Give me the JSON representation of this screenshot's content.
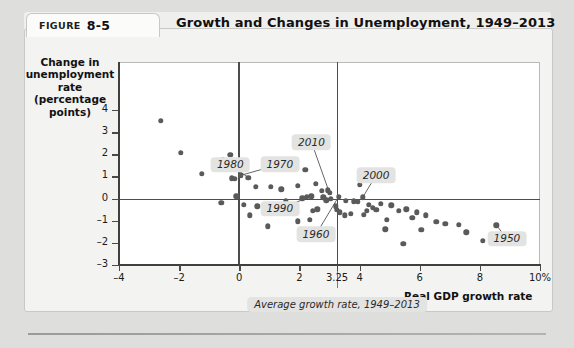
{
  "figure": {
    "label_word": "FIGURE",
    "number": "8-5",
    "title": "Growth and Changes in Unemployment, 1949–2013"
  },
  "chart_data": {
    "type": "scatter",
    "title": "Growth and Changes in Unemployment, 1949–2013",
    "xlabel": "Real GDP growth rate",
    "ylabel": "Change in unemployment rate (percentage points)",
    "xlim": [
      -4,
      10
    ],
    "ylim": [
      -3,
      4
    ],
    "grid": false,
    "legend": null,
    "xticks": [
      -4,
      -2,
      0,
      2,
      3.25,
      4,
      6,
      8,
      10
    ],
    "xticklabels": [
      "-4",
      "-2",
      "0",
      "2",
      "3.25",
      "4",
      "6",
      "8",
      "10%"
    ],
    "yticks": [
      -3,
      -2,
      -1,
      0,
      1,
      2,
      3,
      4
    ],
    "yticklabels": [
      "-3",
      "-2",
      "-1",
      "0",
      "1",
      "2",
      "3",
      "4"
    ],
    "reference_lines": [
      {
        "name": "zero-change-line",
        "axis": "horizontal",
        "value": 0
      },
      {
        "name": "zero-growth-line",
        "axis": "vertical",
        "value": 0
      },
      {
        "name": "average-growth-line",
        "axis": "vertical",
        "value": 3.25
      }
    ],
    "annotations": [
      {
        "label": "1980",
        "label_x": -0.3,
        "label_y": 1.52,
        "point_x": 0.3,
        "point_y": 0.95
      },
      {
        "label": "1970",
        "label_x": 1.35,
        "label_y": 1.55,
        "point_x": 0.05,
        "point_y": 1.05
      },
      {
        "label": "2010",
        "label_x": 2.4,
        "label_y": 2.55,
        "point_x": 3.0,
        "point_y": 0.25
      },
      {
        "label": "2000",
        "label_x": 4.55,
        "label_y": 1.05,
        "point_x": 4.1,
        "point_y": 0.05
      },
      {
        "label": "1990",
        "label_x": 1.35,
        "label_y": -0.45,
        "point_x": 2.4,
        "point_y": 0.1
      },
      {
        "label": "1960",
        "label_x": 2.55,
        "label_y": -1.62,
        "point_x": 3.3,
        "point_y": 0.08
      },
      {
        "label": "1950",
        "label_x": 8.9,
        "label_y": -1.82,
        "point_x": 8.55,
        "point_y": -1.2
      }
    ],
    "average_growth_note": "Average growth rate, 1949–2013",
    "average_growth_value": 3.25,
    "point_color": "#5a5a5a",
    "points": [
      {
        "x": -2.6,
        "y": 3.52
      },
      {
        "x": -1.95,
        "y": 2.08
      },
      {
        "x": -0.3,
        "y": 1.98
      },
      {
        "x": -0.55,
        "y": 1.72
      },
      {
        "x": -0.45,
        "y": 1.5
      },
      {
        "x": -1.25,
        "y": 1.12
      },
      {
        "x": -0.25,
        "y": 0.92
      },
      {
        "x": -0.15,
        "y": 0.88
      },
      {
        "x": 0.05,
        "y": 1.05
      },
      {
        "x": 0.3,
        "y": 0.95
      },
      {
        "x": -0.1,
        "y": 0.1
      },
      {
        "x": 0.55,
        "y": 0.52
      },
      {
        "x": 1.05,
        "y": 0.52
      },
      {
        "x": 1.95,
        "y": 0.58
      },
      {
        "x": 2.2,
        "y": 1.3
      },
      {
        "x": 2.55,
        "y": 0.68
      },
      {
        "x": 2.75,
        "y": 0.35
      },
      {
        "x": 2.95,
        "y": 0.38
      },
      {
        "x": 3.0,
        "y": 0.25
      },
      {
        "x": 2.4,
        "y": 0.1
      },
      {
        "x": 2.25,
        "y": 0.08
      },
      {
        "x": 2.1,
        "y": 0.02
      },
      {
        "x": 2.8,
        "y": 0.05
      },
      {
        "x": 2.9,
        "y": -0.08
      },
      {
        "x": 3.05,
        "y": -0.02
      },
      {
        "x": 3.3,
        "y": 0.08
      },
      {
        "x": 3.2,
        "y": -0.35
      },
      {
        "x": 3.25,
        "y": -0.52
      },
      {
        "x": 3.35,
        "y": -0.62
      },
      {
        "x": 2.6,
        "y": -0.48
      },
      {
        "x": 2.45,
        "y": -0.55
      },
      {
        "x": 1.75,
        "y": -0.45
      },
      {
        "x": 1.55,
        "y": -0.12
      },
      {
        "x": 1.4,
        "y": 0.42
      },
      {
        "x": 1.15,
        "y": -0.62
      },
      {
        "x": 3.55,
        "y": -0.1
      },
      {
        "x": 3.8,
        "y": -0.12
      },
      {
        "x": 3.95,
        "y": -0.15
      },
      {
        "x": 4.1,
        "y": 0.05
      },
      {
        "x": 4.0,
        "y": 0.62
      },
      {
        "x": 4.3,
        "y": -0.28
      },
      {
        "x": 4.45,
        "y": -0.42
      },
      {
        "x": 4.55,
        "y": -0.52
      },
      {
        "x": 4.7,
        "y": -0.25
      },
      {
        "x": 4.25,
        "y": -0.55
      },
      {
        "x": 4.15,
        "y": -0.72
      },
      {
        "x": 3.7,
        "y": -0.68
      },
      {
        "x": 3.5,
        "y": -0.75
      },
      {
        "x": 5.05,
        "y": -0.3
      },
      {
        "x": 5.3,
        "y": -0.55
      },
      {
        "x": 5.55,
        "y": -0.48
      },
      {
        "x": 5.75,
        "y": -0.88
      },
      {
        "x": 5.9,
        "y": -0.62
      },
      {
        "x": 6.2,
        "y": -0.75
      },
      {
        "x": 6.55,
        "y": -1.05
      },
      {
        "x": 6.85,
        "y": -1.15
      },
      {
        "x": 7.3,
        "y": -1.18
      },
      {
        "x": 7.55,
        "y": -1.52
      },
      {
        "x": 8.55,
        "y": -1.2
      },
      {
        "x": 8.1,
        "y": -1.92
      },
      {
        "x": 5.45,
        "y": -2.05
      },
      {
        "x": 4.85,
        "y": -1.38
      },
      {
        "x": 3.05,
        "y": -1.45
      },
      {
        "x": 2.35,
        "y": -0.95
      },
      {
        "x": 1.95,
        "y": -1.02
      },
      {
        "x": 0.6,
        "y": -0.35
      },
      {
        "x": 0.35,
        "y": -0.75
      },
      {
        "x": 0.15,
        "y": -0.28
      },
      {
        "x": -0.6,
        "y": -0.18
      },
      {
        "x": 0.95,
        "y": -1.25
      },
      {
        "x": 4.9,
        "y": -0.95
      },
      {
        "x": 6.05,
        "y": -1.42
      }
    ]
  }
}
